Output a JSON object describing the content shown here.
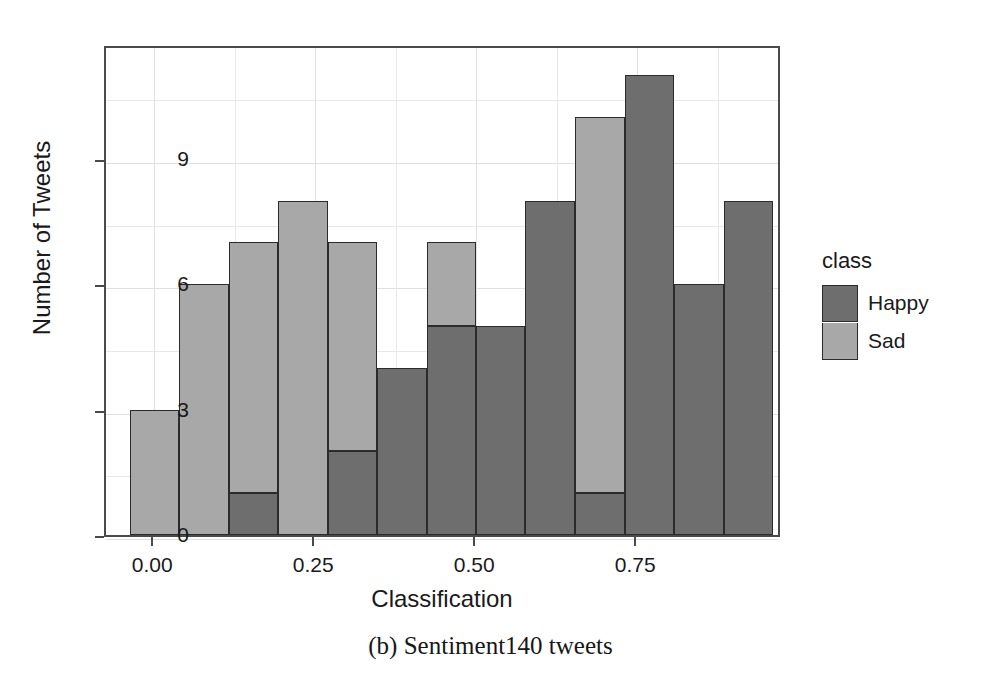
{
  "caption": "(b) Sentiment140 tweets",
  "legend": {
    "title": "class",
    "entries": [
      {
        "label": "Happy",
        "color": "#6e6e6e"
      },
      {
        "label": "Sad",
        "color": "#a8a8a8"
      }
    ]
  },
  "chart_data": {
    "type": "bar",
    "subtype": "stacked-histogram",
    "title": "",
    "xlabel": "Classification",
    "ylabel": "Number of Tweets",
    "xlim": [
      -0.075,
      0.975
    ],
    "ylim": [
      0,
      11.75
    ],
    "grid": true,
    "legend_position": "right",
    "xticks": [
      "0.00",
      "0.25",
      "0.50",
      "0.75"
    ],
    "xtick_values": [
      0.0,
      0.25,
      0.5,
      0.75
    ],
    "yticks": [
      "0",
      "3",
      "6",
      "9"
    ],
    "ytick_values": [
      0,
      3,
      6,
      9
    ],
    "bin_width": 0.0769,
    "bin_centers": [
      0.0,
      0.077,
      0.154,
      0.231,
      0.308,
      0.385,
      0.462,
      0.538,
      0.615,
      0.692,
      0.769,
      0.846,
      0.923
    ],
    "categories": [
      "0.00",
      "0.08",
      "0.15",
      "0.23",
      "0.31",
      "0.38",
      "0.46",
      "0.54",
      "0.62",
      "0.69",
      "0.77",
      "0.85",
      "0.92"
    ],
    "series": [
      {
        "name": "Happy",
        "color": "#6e6e6e",
        "values": [
          0,
          0,
          1,
          0,
          2,
          4,
          5,
          5,
          8,
          1,
          11,
          6,
          8
        ]
      },
      {
        "name": "Sad",
        "color": "#a8a8a8",
        "values": [
          3,
          6,
          6,
          8,
          5,
          0,
          2,
          0,
          0,
          9,
          0,
          0,
          0
        ]
      }
    ],
    "totals": [
      3,
      6,
      7,
      8,
      7,
      4,
      7,
      5,
      8,
      10,
      11,
      6,
      8
    ]
  }
}
